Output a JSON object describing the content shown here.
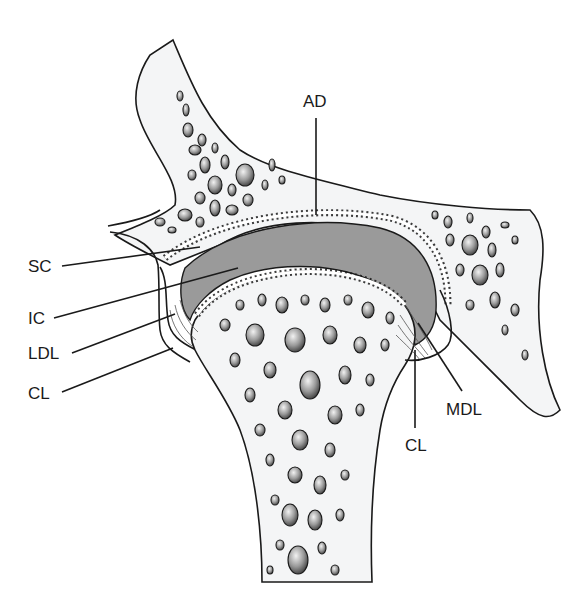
{
  "diagram": {
    "labels": [
      {
        "id": "AD",
        "text": "AD",
        "x": 303,
        "y": 107
      },
      {
        "id": "SC",
        "text": "SC",
        "x": 28,
        "y": 272
      },
      {
        "id": "IC",
        "text": "IC",
        "x": 28,
        "y": 324
      },
      {
        "id": "LDL",
        "text": "LDL",
        "x": 28,
        "y": 359
      },
      {
        "id": "CL_left",
        "text": "CL",
        "x": 28,
        "y": 399
      },
      {
        "id": "MDL",
        "text": "MDL",
        "x": 446,
        "y": 415
      },
      {
        "id": "CL_right",
        "text": "CL",
        "x": 405,
        "y": 451
      }
    ],
    "colors": {
      "bone_fill": "#f4f5f6",
      "outline": "#1a1a1a",
      "cavity_gray": "#9a9a9a",
      "cartilage": "#e8e8e8"
    }
  }
}
